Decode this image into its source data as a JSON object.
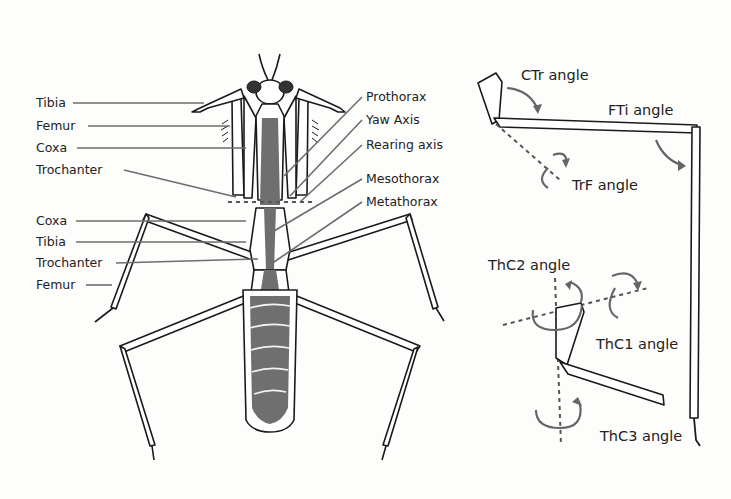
{
  "figure": {
    "colors": {
      "background": "#fdfdfc",
      "outline": "#1a1a1a",
      "body_fill": "#6f6f6f",
      "leader_line": "#6d6d6d",
      "text": "#222222",
      "arrow": "#666666"
    }
  },
  "left_labels": {
    "foreleg": [
      "Tibia",
      "Femur",
      "Coxa",
      "Trochanter"
    ],
    "hindleg": [
      "Coxa",
      "Tibia",
      "Trochanter",
      "Femur"
    ]
  },
  "right_labels": [
    "Prothorax",
    "Yaw Axis",
    "Rearing axis",
    "Mesothorax",
    "Metathorax"
  ],
  "joint_angles_top": {
    "ctr": "CTr angle",
    "fti": "FTi angle",
    "trf": "TrF angle"
  },
  "joint_angles_bottom": {
    "thc2": "ThC2 angle",
    "thc1": "ThC1 angle",
    "thc3": "ThC3 angle"
  }
}
